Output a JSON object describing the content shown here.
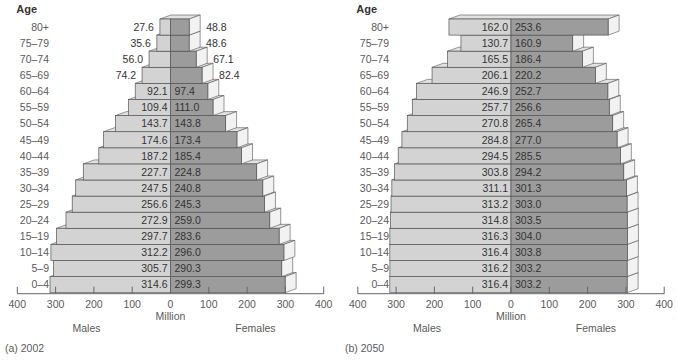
{
  "chart_data": [
    {
      "type": "bar",
      "subtype": "population-pyramid",
      "panel_label": "(a) 2002",
      "age_header": "Age",
      "xlabel": "Million",
      "left_label": "Males",
      "right_label": "Females",
      "xlim": [
        0,
        400
      ],
      "ticks": [
        "400",
        "300",
        "200",
        "100",
        "0",
        "100",
        "200",
        "300",
        "400"
      ],
      "tick_values": [
        400,
        300,
        200,
        100,
        0,
        100,
        200,
        300,
        400
      ],
      "categories": [
        "80+",
        "75–79",
        "70–74",
        "65–69",
        "60–64",
        "55–59",
        "50–54",
        "45–49",
        "40–44",
        "35–39",
        "30–34",
        "25–29",
        "20–24",
        "15–19",
        "10–14",
        "5–9",
        "0–4"
      ],
      "series": [
        {
          "name": "Males",
          "values": [
            27.6,
            35.6,
            56.0,
            74.2,
            92.1,
            109.4,
            143.7,
            174.6,
            187.2,
            227.7,
            247.5,
            256.6,
            272.9,
            297.7,
            312.2,
            305.7,
            314.6
          ],
          "labels": [
            "27.6",
            "35.6",
            "56.0",
            "74.2",
            "92.1",
            "109.4",
            "143.7",
            "174.6",
            "187.2",
            "227.7",
            "247.5",
            "256.6",
            "272.9",
            "297.7",
            "312.2",
            "305.7",
            "314.6"
          ]
        },
        {
          "name": "Females",
          "values": [
            48.8,
            48.6,
            67.1,
            82.4,
            97.4,
            111.0,
            143.8,
            173.4,
            185.4,
            224.8,
            240.8,
            245.3,
            259.0,
            283.6,
            296.0,
            290.3,
            299.3
          ],
          "labels": [
            "48.8",
            "48.6",
            "67.1",
            "82.4",
            "97.4",
            "111.0",
            "143.8",
            "173.4",
            "185.4",
            "224.8",
            "240.8",
            "245.3",
            "259.0",
            "283.6",
            "296.0",
            "290.3",
            "299.3"
          ]
        }
      ]
    },
    {
      "type": "bar",
      "subtype": "population-pyramid",
      "panel_label": "(b) 2050",
      "age_header": "Age",
      "xlabel": "Million",
      "left_label": "Males",
      "right_label": "Females",
      "xlim": [
        0,
        400
      ],
      "ticks": [
        "400",
        "300",
        "200",
        "100",
        "0",
        "100",
        "200",
        "300",
        "400"
      ],
      "tick_values": [
        400,
        300,
        200,
        100,
        0,
        100,
        200,
        300,
        400
      ],
      "categories": [
        "80+",
        "75–79",
        "70–74",
        "65–69",
        "60–64",
        "55–59",
        "50–54",
        "45–49",
        "40–44",
        "35–39",
        "30–34",
        "25–29",
        "20–24",
        "15–19",
        "10–14",
        "5–9",
        "0–4"
      ],
      "series": [
        {
          "name": "Males",
          "values": [
            162.0,
            130.7,
            165.5,
            206.1,
            246.9,
            257.7,
            270.8,
            284.8,
            294.5,
            303.8,
            311.1,
            313.2,
            314.8,
            316.3,
            316.4,
            316.2,
            316.4
          ],
          "labels": [
            "162.0",
            "130.7",
            "165.5",
            "206.1",
            "246.9",
            "257.7",
            "270.8",
            "284.8",
            "294.5",
            "303.8",
            "311.1",
            "313.2",
            "314.8",
            "316.3",
            "316.4",
            "316.2",
            "316.4"
          ]
        },
        {
          "name": "Females",
          "values": [
            253.6,
            160.9,
            186.4,
            220.2,
            252.7,
            256.6,
            265.4,
            277.0,
            285.5,
            294.2,
            301.3,
            303.0,
            303.5,
            304.0,
            303.8,
            303.2,
            303.2
          ],
          "labels": [
            "253.6",
            "160.9",
            "186.4",
            "220.2",
            "252.7",
            "256.6",
            "265.4",
            "277.0",
            "285.5",
            "294.2",
            "301.3",
            "303.0",
            "303.5",
            "304.0",
            "303.8",
            "303.2",
            "303.2"
          ]
        }
      ]
    }
  ],
  "colors": {
    "male_face": "#d3d3d3",
    "female_face": "#9c9c9c",
    "side_face": "#f2f2f2",
    "top_face": "#e2e2e2",
    "outline": "#555555"
  }
}
